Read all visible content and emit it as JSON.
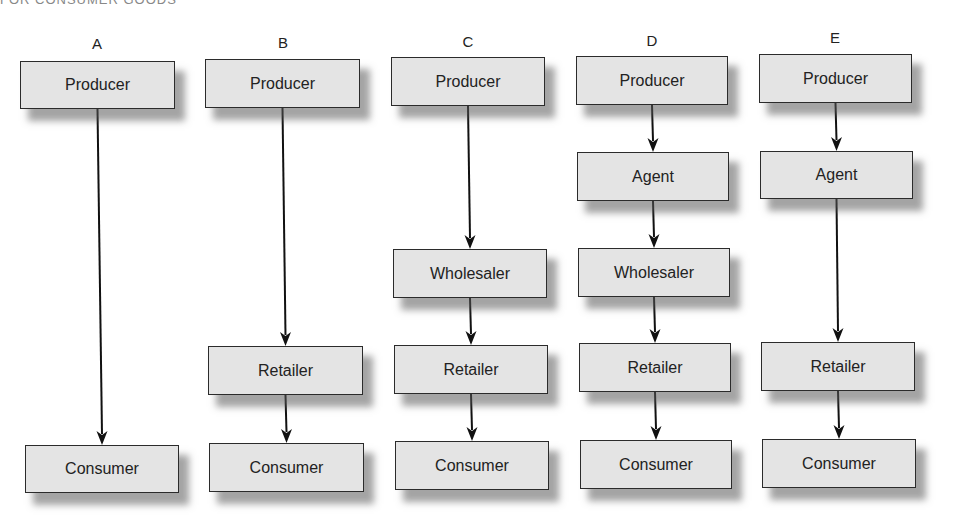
{
  "caption": "FOR CONSUMER GOODS",
  "chains": [
    {
      "label": "A",
      "label_pos": [
        97,
        36
      ],
      "nodes": [
        {
          "text": "Producer",
          "x": 20,
          "y": 61,
          "w": 155,
          "h": 48
        },
        {
          "text": "Consumer",
          "x": 25,
          "y": 445,
          "w": 154,
          "h": 48
        }
      ]
    },
    {
      "label": "B",
      "label_pos": [
        283,
        35
      ],
      "nodes": [
        {
          "text": "Producer",
          "x": 205,
          "y": 59,
          "w": 155,
          "h": 49
        },
        {
          "text": "Retailer",
          "x": 208,
          "y": 346,
          "w": 155,
          "h": 49
        },
        {
          "text": "Consumer",
          "x": 209,
          "y": 443,
          "w": 155,
          "h": 49
        }
      ]
    },
    {
      "label": "C",
      "label_pos": [
        468,
        34
      ],
      "nodes": [
        {
          "text": "Producer",
          "x": 391,
          "y": 57,
          "w": 154,
          "h": 49
        },
        {
          "text": "Wholesaler",
          "x": 393,
          "y": 249,
          "w": 154,
          "h": 49
        },
        {
          "text": "Retailer",
          "x": 394,
          "y": 345,
          "w": 154,
          "h": 49
        },
        {
          "text": "Consumer",
          "x": 395,
          "y": 441,
          "w": 154,
          "h": 49
        }
      ]
    },
    {
      "label": "D",
      "label_pos": [
        652,
        33
      ],
      "nodes": [
        {
          "text": "Producer",
          "x": 576,
          "y": 56,
          "w": 152,
          "h": 49
        },
        {
          "text": "Agent",
          "x": 577,
          "y": 152,
          "w": 152,
          "h": 49
        },
        {
          "text": "Wholesaler",
          "x": 578,
          "y": 248,
          "w": 152,
          "h": 49
        },
        {
          "text": "Retailer",
          "x": 579,
          "y": 343,
          "w": 152,
          "h": 49
        },
        {
          "text": "Consumer",
          "x": 580,
          "y": 440,
          "w": 152,
          "h": 49
        }
      ]
    },
    {
      "label": "E",
      "label_pos": [
        835,
        30
      ],
      "nodes": [
        {
          "text": "Producer",
          "x": 759,
          "y": 54,
          "w": 153,
          "h": 49
        },
        {
          "text": "Agent",
          "x": 760,
          "y": 151,
          "w": 153,
          "h": 48
        },
        {
          "text": "Retailer",
          "x": 761,
          "y": 342,
          "w": 154,
          "h": 49
        },
        {
          "text": "Consumer",
          "x": 762,
          "y": 439,
          "w": 154,
          "h": 49
        }
      ]
    }
  ],
  "style": {
    "node_fill": "#e4e4e4",
    "node_border": "#2b2b2b",
    "arrow_color": "#111111",
    "shadow_color": "#7a7a7a"
  }
}
